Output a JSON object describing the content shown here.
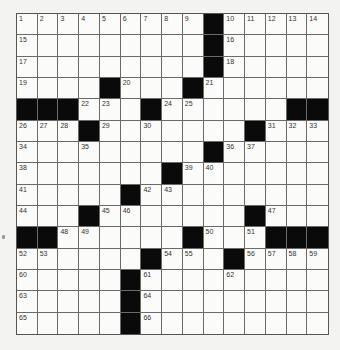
{
  "puzzle": {
    "rows": 15,
    "cols": 15,
    "black_cells": [
      [
        0,
        9
      ],
      [
        1,
        9
      ],
      [
        2,
        9
      ],
      [
        3,
        4
      ],
      [
        3,
        8
      ],
      [
        4,
        0
      ],
      [
        4,
        1
      ],
      [
        4,
        2
      ],
      [
        4,
        6
      ],
      [
        4,
        13
      ],
      [
        4,
        14
      ],
      [
        5,
        3
      ],
      [
        5,
        11
      ],
      [
        6,
        9
      ],
      [
        7,
        7
      ],
      [
        8,
        5
      ],
      [
        9,
        3
      ],
      [
        9,
        11
      ],
      [
        10,
        0
      ],
      [
        10,
        1
      ],
      [
        10,
        8
      ],
      [
        10,
        12
      ],
      [
        10,
        13
      ],
      [
        10,
        14
      ],
      [
        11,
        6
      ],
      [
        11,
        10
      ],
      [
        12,
        5
      ],
      [
        13,
        5
      ],
      [
        14,
        5
      ]
    ],
    "numbers": [
      {
        "r": 0,
        "c": 0,
        "n": "1"
      },
      {
        "r": 0,
        "c": 1,
        "n": "2"
      },
      {
        "r": 0,
        "c": 2,
        "n": "3"
      },
      {
        "r": 0,
        "c": 3,
        "n": "4"
      },
      {
        "r": 0,
        "c": 4,
        "n": "5"
      },
      {
        "r": 0,
        "c": 5,
        "n": "6"
      },
      {
        "r": 0,
        "c": 6,
        "n": "7"
      },
      {
        "r": 0,
        "c": 7,
        "n": "8"
      },
      {
        "r": 0,
        "c": 8,
        "n": "9"
      },
      {
        "r": 0,
        "c": 10,
        "n": "10"
      },
      {
        "r": 0,
        "c": 11,
        "n": "11"
      },
      {
        "r": 0,
        "c": 12,
        "n": "12"
      },
      {
        "r": 0,
        "c": 13,
        "n": "13"
      },
      {
        "r": 0,
        "c": 14,
        "n": "14"
      },
      {
        "r": 1,
        "c": 0,
        "n": "15"
      },
      {
        "r": 1,
        "c": 10,
        "n": "16"
      },
      {
        "r": 2,
        "c": 0,
        "n": "17"
      },
      {
        "r": 2,
        "c": 10,
        "n": "18"
      },
      {
        "r": 3,
        "c": 0,
        "n": "19"
      },
      {
        "r": 3,
        "c": 5,
        "n": "20"
      },
      {
        "r": 3,
        "c": 9,
        "n": "21"
      },
      {
        "r": 4,
        "c": 3,
        "n": "22"
      },
      {
        "r": 4,
        "c": 4,
        "n": "23"
      },
      {
        "r": 4,
        "c": 7,
        "n": "24"
      },
      {
        "r": 4,
        "c": 8,
        "n": "25"
      },
      {
        "r": 5,
        "c": 0,
        "n": "26"
      },
      {
        "r": 5,
        "c": 1,
        "n": "27"
      },
      {
        "r": 5,
        "c": 2,
        "n": "28"
      },
      {
        "r": 5,
        "c": 4,
        "n": "29"
      },
      {
        "r": 5,
        "c": 6,
        "n": "30"
      },
      {
        "r": 5,
        "c": 12,
        "n": "31"
      },
      {
        "r": 5,
        "c": 13,
        "n": "32"
      },
      {
        "r": 5,
        "c": 14,
        "n": "33"
      },
      {
        "r": 6,
        "c": 0,
        "n": "34"
      },
      {
        "r": 6,
        "c": 3,
        "n": "35"
      },
      {
        "r": 6,
        "c": 10,
        "n": "36"
      },
      {
        "r": 6,
        "c": 11,
        "n": "37"
      },
      {
        "r": 7,
        "c": 0,
        "n": "38"
      },
      {
        "r": 7,
        "c": 8,
        "n": "39"
      },
      {
        "r": 7,
        "c": 9,
        "n": "40"
      },
      {
        "r": 8,
        "c": 0,
        "n": "41"
      },
      {
        "r": 8,
        "c": 6,
        "n": "42"
      },
      {
        "r": 8,
        "c": 7,
        "n": "43"
      },
      {
        "r": 9,
        "c": 0,
        "n": "44"
      },
      {
        "r": 9,
        "c": 4,
        "n": "45"
      },
      {
        "r": 9,
        "c": 5,
        "n": "46"
      },
      {
        "r": 9,
        "c": 12,
        "n": "47"
      },
      {
        "r": 10,
        "c": 2,
        "n": "48"
      },
      {
        "r": 10,
        "c": 3,
        "n": "49"
      },
      {
        "r": 10,
        "c": 9,
        "n": "50"
      },
      {
        "r": 10,
        "c": 11,
        "n": "51"
      },
      {
        "r": 11,
        "c": 0,
        "n": "52"
      },
      {
        "r": 11,
        "c": 1,
        "n": "53"
      },
      {
        "r": 11,
        "c": 7,
        "n": "54"
      },
      {
        "r": 11,
        "c": 8,
        "n": "55"
      },
      {
        "r": 11,
        "c": 11,
        "n": "56"
      },
      {
        "r": 11,
        "c": 12,
        "n": "57"
      },
      {
        "r": 11,
        "c": 13,
        "n": "58"
      },
      {
        "r": 11,
        "c": 14,
        "n": "59"
      },
      {
        "r": 12,
        "c": 0,
        "n": "60"
      },
      {
        "r": 12,
        "c": 6,
        "n": "61"
      },
      {
        "r": 12,
        "c": 10,
        "n": "62"
      },
      {
        "r": 13,
        "c": 0,
        "n": "63"
      },
      {
        "r": 13,
        "c": 6,
        "n": "64"
      },
      {
        "r": 14,
        "c": 0,
        "n": "65"
      },
      {
        "r": 14,
        "c": 6,
        "n": "66"
      }
    ]
  },
  "colors": {
    "black_square": "#0a0a0a",
    "white_square": "#fbfbf9",
    "grid_line": "#6a6a6a",
    "background": "#f3f3f1"
  }
}
